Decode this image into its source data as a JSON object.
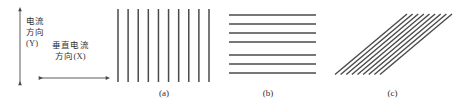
{
  "figure": {
    "background_color": "#ffffff",
    "line_color": "#4a4a4a",
    "text_color": "#333333"
  },
  "axis_diagram": {
    "y_axis": {
      "name": "current-direction-axis",
      "arrow_style": "double-headed",
      "orientation": "vertical",
      "label_lines": [
        "电流",
        "方向",
        "(Y)"
      ]
    },
    "x_axis": {
      "name": "perpendicular-current-direction-axis",
      "arrow_style": "double-headed",
      "orientation": "horizontal",
      "label_lines": [
        "垂直电流",
        "方向(X)"
      ]
    }
  },
  "panels": [
    {
      "id": "a",
      "caption": "(a)",
      "pattern": "vertical-lines",
      "line_count": 10,
      "angle_deg": 90,
      "description": "平行于电流方向的条纹"
    },
    {
      "id": "b",
      "caption": "(b)",
      "pattern": "horizontal-lines",
      "line_count": 7,
      "angle_deg": 0,
      "description": "垂直于电流方向的条纹"
    },
    {
      "id": "c",
      "caption": "(c)",
      "pattern": "diagonal-lines",
      "line_count": 9,
      "angle_deg": 40,
      "description": "与电流方向斜交的条纹"
    }
  ]
}
